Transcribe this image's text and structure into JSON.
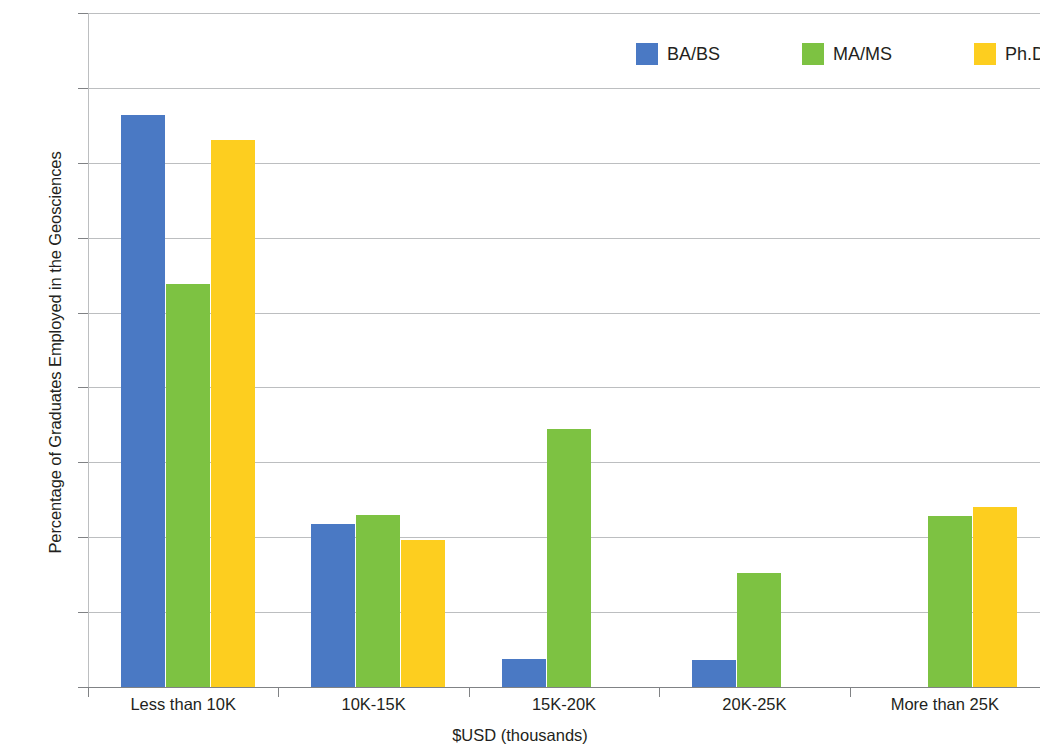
{
  "chart_data": {
    "type": "bar",
    "title": "",
    "xlabel": "$USD (thousands)",
    "ylabel": "Percentage of Graduates Employed in the Geosciences",
    "categories": [
      "Less than 10K",
      "10K-15K",
      "15K-20K",
      "20K-25K",
      "More than 25K"
    ],
    "series": [
      {
        "name": "BA/BS",
        "color": "#4A79C4",
        "values": [
          38.2,
          10.9,
          1.9,
          1.8,
          0
        ]
      },
      {
        "name": "MA/MS",
        "color": "#7DC242",
        "values": [
          26.9,
          11.5,
          17.2,
          7.6,
          11.4
        ]
      },
      {
        "name": "Ph.D.",
        "color": "#FDCE1F",
        "values": [
          36.5,
          9.8,
          0,
          0,
          12.0
        ]
      }
    ],
    "ylim": [
      0,
      45
    ],
    "ytick_labels": [
      "0%",
      "5%",
      "10%",
      "15%",
      "20%",
      "25%",
      "30%",
      "35%",
      "40%",
      "45%"
    ],
    "ytick_values": [
      0,
      5,
      10,
      15,
      20,
      25,
      30,
      35,
      40,
      45
    ],
    "grid": true,
    "legend_position": "top-right"
  },
  "colors": {
    "bachelors": "#4A79C4",
    "masters": "#7DC242",
    "doctorate": "#FDCE1F",
    "gridline": "#bcbec0",
    "axis": "#808285",
    "text": "#231f20",
    "background": "#ffffff"
  }
}
